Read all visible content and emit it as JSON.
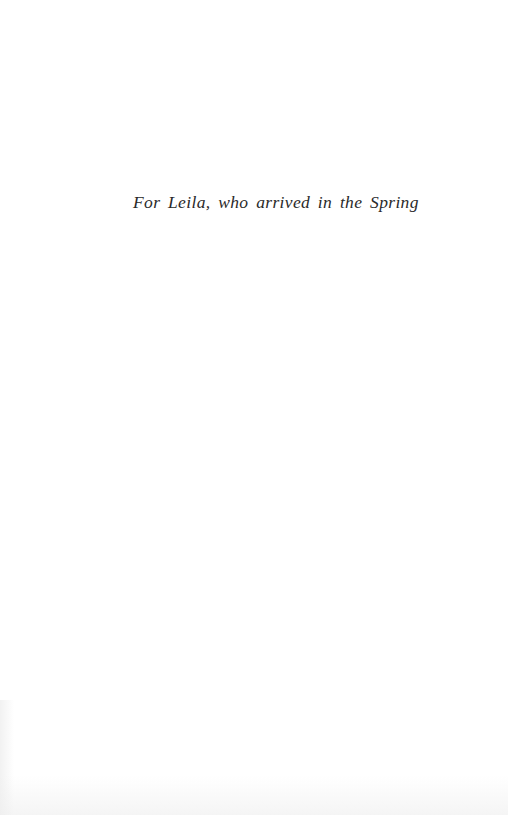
{
  "page": {
    "type": "dedication",
    "dedication_text": "For Leila, who arrived in the Spring"
  },
  "colors": {
    "background": "#ffffff",
    "text": "#2a2a2a"
  }
}
